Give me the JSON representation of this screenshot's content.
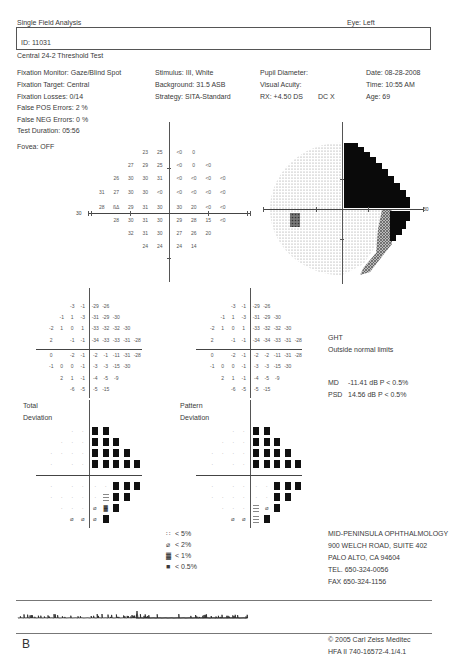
{
  "header": {
    "title": "Single Field Analysis",
    "eye": "Eye: Left",
    "patient_id": "ID: 11031",
    "test_name": "Central 24-2 Threshold Test"
  },
  "params": {
    "col1": [
      "Fixation Monitor: Gaze/Blind Spot",
      "Fixation Target: Central",
      "Fixation Losses: 0/14",
      "False POS Errors:  2 %",
      "False NEG Errors:  0 %",
      "Test Duration: 05:56"
    ],
    "col2": [
      "Stimulus: III, White",
      "Background: 31.5 ASB",
      "Strategy: SITA-Standard"
    ],
    "col3": [
      "Pupil Diameter:",
      "Visual Acuity:",
      "RX: +4.50 DS"
    ],
    "rx_dc": "DC  X",
    "col4": [
      "Date: 08-28-2008",
      "Time: 10:55 AM",
      "Age: 69"
    ],
    "fovea": "Fovea: OFF"
  },
  "threshold_plot": {
    "axis_label_left": "30",
    "axis_label_right": "30",
    "rows": [
      {
        "cols": [
          -2,
          -1,
          0,
          1
        ],
        "values": [
          "23",
          "25",
          "<0",
          "0"
        ]
      },
      {
        "cols": [
          -3,
          -2,
          -1,
          0,
          1,
          2
        ],
        "values": [
          "27",
          "29",
          "25",
          "<0",
          "0",
          "<0"
        ]
      },
      {
        "cols": [
          -4,
          -3,
          -2,
          -1,
          0,
          1,
          2,
          3
        ],
        "values": [
          "26",
          "30",
          "30",
          "31",
          "<0",
          "<0",
          "<0",
          "<0"
        ]
      },
      {
        "cols": [
          -5,
          -4,
          -3,
          -2,
          -1,
          0,
          1,
          2,
          3,
          4
        ],
        "values": [
          "31",
          "27",
          "30",
          "30",
          "<0",
          "<0",
          "<0",
          "<0",
          "<0"
        ],
        "skip_first": true
      },
      {
        "cols": [
          -5,
          -4,
          -3,
          -2,
          -1,
          0,
          1,
          2,
          3,
          4
        ],
        "values": [
          "28",
          "BS",
          "29",
          "31",
          "30",
          "30",
          "20",
          "<0",
          "<0"
        ],
        "skip_first": true
      },
      {
        "cols": [
          -4,
          -3,
          -2,
          -1,
          0,
          1,
          2,
          3
        ],
        "values": [
          "28",
          "30",
          "31",
          "30",
          "29",
          "28",
          "15",
          "<0"
        ]
      },
      {
        "cols": [
          -3,
          -2,
          -1,
          0,
          1,
          2
        ],
        "values": [
          "32",
          "31",
          "30",
          "27",
          "26",
          "20"
        ]
      },
      {
        "cols": [
          -2,
          -1,
          0,
          1
        ],
        "values": [
          "24",
          "24",
          "24",
          "14"
        ]
      }
    ]
  },
  "total_deviation": {
    "label_1": "Total",
    "label_2": "Deviation",
    "rows": [
      [
        "",
        "",
        "",
        "-3",
        "-1",
        "-29",
        "-26",
        "",
        "",
        ""
      ],
      [
        "",
        "",
        "-1",
        "1",
        "-3",
        "-31",
        "-29",
        "-30",
        "",
        ""
      ],
      [
        "",
        "-2",
        "1",
        "0",
        "1",
        "-33",
        "-32",
        "-32",
        "-30",
        ""
      ],
      [
        "",
        "2",
        "",
        "-1",
        "-1",
        "-34",
        "-33",
        "-33",
        "-31",
        "-28"
      ],
      [
        "",
        "0",
        "",
        "-2",
        "-1",
        "-2",
        "-1",
        "-11",
        "-31",
        "-28"
      ],
      [
        "",
        "-1",
        "0",
        "0",
        "-1",
        "-3",
        "-3",
        "-15",
        "-30",
        ""
      ],
      [
        "",
        "",
        "2",
        "1",
        "-1",
        "-4",
        "-5",
        "-9",
        "",
        ""
      ],
      [
        "",
        "",
        "",
        "-6",
        "-5",
        "-5",
        "-15",
        "",
        "",
        ""
      ]
    ]
  },
  "pattern_deviation": {
    "label_1": "Pattern",
    "label_2": "Deviation",
    "rows": [
      [
        "",
        "",
        "",
        "-3",
        "-1",
        "-29",
        "-26",
        "",
        "",
        ""
      ],
      [
        "",
        "",
        "-1",
        "1",
        "-3",
        "-31",
        "-29",
        "-30",
        "",
        ""
      ],
      [
        "",
        "-2",
        "1",
        "0",
        "1",
        "-33",
        "-32",
        "-32",
        "-30",
        ""
      ],
      [
        "",
        "2",
        "",
        "-1",
        "-1",
        "-34",
        "-34",
        "-33",
        "-31",
        "-28"
      ],
      [
        "",
        "0",
        "",
        "-2",
        "-1",
        "-2",
        "-2",
        "-11",
        "-31",
        "-28"
      ],
      [
        "",
        "-1",
        "0",
        "0",
        "-1",
        "-3",
        "-3",
        "-15",
        "-30",
        ""
      ],
      [
        "",
        "",
        "2",
        "1",
        "-1",
        "-4",
        "-5",
        "-9",
        "",
        ""
      ],
      [
        "",
        "",
        "",
        "-6",
        "-5",
        "-5",
        "-15",
        "",
        "",
        ""
      ]
    ]
  },
  "total_prob_map": [
    [
      "",
      "",
      "",
      "n",
      "n",
      "b",
      "b",
      "",
      "",
      ""
    ],
    [
      "",
      "",
      "n",
      "n",
      "n",
      "b",
      "b",
      "b",
      "",
      ""
    ],
    [
      "",
      "n",
      "n",
      "n",
      "n",
      "b",
      "b",
      "b",
      "b",
      ""
    ],
    [
      "",
      "n",
      "",
      "n",
      "n",
      "b",
      "b",
      "b",
      "b",
      "b"
    ],
    [
      "",
      "n",
      "",
      "n",
      "n",
      "n",
      "n",
      "b",
      "b",
      "b"
    ],
    [
      "",
      "n",
      "n",
      "n",
      "n",
      "n",
      "d5",
      "b",
      "b",
      ""
    ],
    [
      "",
      "",
      "n",
      "n",
      "n",
      "d2",
      "d1",
      "b",
      "",
      ""
    ],
    [
      "",
      "",
      "",
      "d2",
      "d2",
      "d2",
      "b",
      "",
      "",
      ""
    ]
  ],
  "pattern_prob_map": [
    [
      "",
      "",
      "",
      "n",
      "n",
      "b",
      "b",
      "",
      "",
      ""
    ],
    [
      "",
      "",
      "n",
      "n",
      "n",
      "b",
      "b",
      "b",
      "",
      ""
    ],
    [
      "",
      "n",
      "n",
      "n",
      "n",
      "b",
      "b",
      "b",
      "b",
      ""
    ],
    [
      "",
      "n",
      "",
      "n",
      "n",
      "b",
      "b",
      "b",
      "b",
      "b"
    ],
    [
      "",
      "n",
      "",
      "n",
      "n",
      "n",
      "n",
      "b",
      "b",
      "b"
    ],
    [
      "",
      "n",
      "n",
      "n",
      "n",
      "n",
      "n",
      "b",
      "b",
      ""
    ],
    [
      "",
      "",
      "n",
      "n",
      "n",
      "d5",
      "d2",
      "b",
      "",
      ""
    ],
    [
      "",
      "",
      "",
      "d2",
      "d2",
      "d5",
      "b",
      "",
      "",
      ""
    ]
  ],
  "legend": {
    "items": [
      {
        "symbol": "∷",
        "label": "< 5%"
      },
      {
        "symbol": "⌀",
        "label": "< 2%"
      },
      {
        "symbol": "▓",
        "label": "< 1%"
      },
      {
        "symbol": "■",
        "label": "< 0.5%"
      }
    ]
  },
  "ght": {
    "title": "GHT",
    "result": "Outside normal limits"
  },
  "indices": {
    "md_label": "MD",
    "md_value": "-11.41 dB  P < 0.5%",
    "psd_label": "PSD",
    "psd_value": "14.56 dB  P < 0.5%"
  },
  "clinic": {
    "lines": [
      "MID-PENINSULA OPHTHALMOLOGY",
      "900 WELCH ROAD, SUITE 402",
      "PALO ALTO, CA 94604",
      "TEL. 650-324-0056",
      "FAX 650-324-1156"
    ]
  },
  "footer": {
    "panel_letter": "B",
    "copyright": "© 2005 Carl Zeiss Meditec",
    "device": "HFA II 740-16572-4.1/4.1"
  }
}
